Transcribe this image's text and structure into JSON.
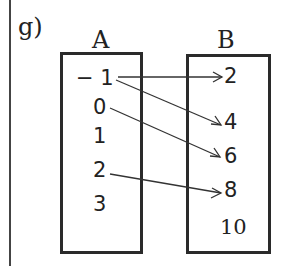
{
  "problem_label": "g)",
  "set_a": {
    "name": "A",
    "elements": [
      "− 1",
      "0",
      "1",
      "2",
      "3"
    ]
  },
  "set_b": {
    "name": "B",
    "elements": [
      "2",
      "4",
      "6",
      "8",
      "10"
    ]
  },
  "mappings": [
    {
      "from": "-1",
      "to": "2"
    },
    {
      "from": "-1",
      "to": "4"
    },
    {
      "from": "0",
      "to": "6"
    },
    {
      "from": "2",
      "to": "8"
    }
  ]
}
